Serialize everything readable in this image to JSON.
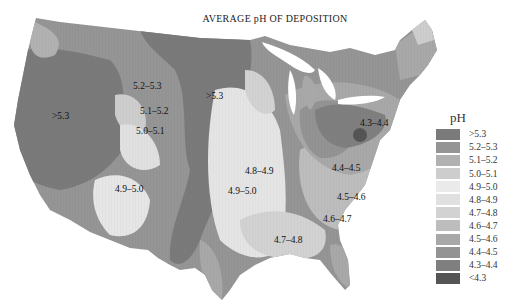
{
  "title": "AVERAGE pH OF DEPOSITION",
  "legend": {
    "title": "pH",
    "items": [
      {
        "label": ">5.3",
        "color": "#7a7a7a"
      },
      {
        "label": "5.2–5.3",
        "color": "#959595"
      },
      {
        "label": "5.1–5.2",
        "color": "#b1b1b1"
      },
      {
        "label": "5.0–5.1",
        "color": "#cdcdcd"
      },
      {
        "label": "4.9–5.0",
        "color": "#eaeaea"
      },
      {
        "label": "4.8–4.9",
        "color": "#e0e0e0"
      },
      {
        "label": "4.7–4.8",
        "color": "#d2d2d2"
      },
      {
        "label": "4.6–4.7",
        "color": "#bdbdbd"
      },
      {
        "label": "4.5–4.6",
        "color": "#a8a8a8"
      },
      {
        "label": "4.4–4.5",
        "color": "#939393"
      },
      {
        "label": "4.3–4.4",
        "color": "#7f7f7f"
      },
      {
        "label": "<4.3",
        "color": "#555555"
      }
    ]
  },
  "map_labels": {
    "west_gt53": ">5.3",
    "nw_52_53": "5.2–5.3",
    "nw_51_52": "5.1–5.2",
    "nw_50_51": "5.0–5.1",
    "plains_gt53": ">5.3",
    "sw_49_50": "4.9–5.0",
    "central_48_49": "4.8–4.9",
    "central_49_50": "4.9–5.0",
    "south_47_48": "4.7–4.8",
    "ohio_43_44": "4.3–4.4",
    "east_44_45": "4.4–4.5",
    "east_45_46": "4.5–4.6",
    "se_46_47": "4.6–4.7"
  }
}
